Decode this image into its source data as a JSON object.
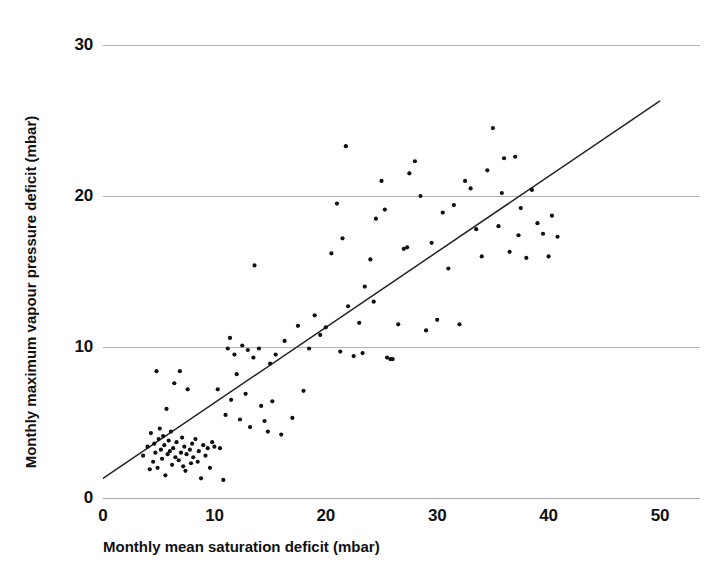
{
  "chart_data": {
    "type": "scatter",
    "title": "",
    "xlabel": "Monthly mean saturation deficit (mbar)",
    "ylabel": "Monthly maximum vapour pressure deficit (mbar)",
    "xlim": [
      0,
      50
    ],
    "ylim": [
      0,
      30
    ],
    "xticks": [
      0,
      10,
      20,
      30,
      40,
      50
    ],
    "yticks": [
      0,
      10,
      20,
      30
    ],
    "xtick_labels": [
      "0",
      "10",
      "20",
      "30",
      "40",
      "50"
    ],
    "ytick_labels": [
      "0",
      "10",
      "20",
      "30"
    ],
    "grid": "horizontal",
    "grid_color": "#aaaaaa",
    "legend": "none",
    "marker": {
      "shape": "dot",
      "size": 2.1,
      "color": "#111111"
    },
    "series": [
      {
        "name": "Monthly observations",
        "points": [
          [
            3.6,
            2.8
          ],
          [
            4.0,
            3.4
          ],
          [
            4.2,
            1.9
          ],
          [
            4.3,
            4.3
          ],
          [
            4.5,
            2.4
          ],
          [
            4.6,
            3.6
          ],
          [
            4.7,
            3.0
          ],
          [
            4.8,
            8.4
          ],
          [
            4.9,
            2.0
          ],
          [
            5.0,
            3.9
          ],
          [
            5.1,
            4.6
          ],
          [
            5.2,
            3.2
          ],
          [
            5.3,
            2.6
          ],
          [
            5.4,
            4.1
          ],
          [
            5.5,
            3.5
          ],
          [
            5.6,
            1.5
          ],
          [
            5.7,
            5.9
          ],
          [
            5.8,
            2.9
          ],
          [
            5.9,
            3.8
          ],
          [
            6.0,
            3.1
          ],
          [
            6.1,
            4.4
          ],
          [
            6.2,
            2.2
          ],
          [
            6.3,
            3.3
          ],
          [
            6.4,
            7.6
          ],
          [
            6.5,
            2.7
          ],
          [
            6.6,
            3.7
          ],
          [
            6.8,
            2.5
          ],
          [
            6.9,
            8.4
          ],
          [
            7.0,
            3.0
          ],
          [
            7.1,
            4.0
          ],
          [
            7.2,
            2.1
          ],
          [
            7.3,
            3.4
          ],
          [
            7.4,
            1.8
          ],
          [
            7.5,
            2.9
          ],
          [
            7.6,
            7.2
          ],
          [
            7.8,
            3.2
          ],
          [
            7.9,
            2.3
          ],
          [
            8.0,
            3.6
          ],
          [
            8.1,
            2.7
          ],
          [
            8.3,
            3.9
          ],
          [
            8.5,
            2.4
          ],
          [
            8.6,
            3.1
          ],
          [
            8.8,
            1.3
          ],
          [
            9.0,
            3.5
          ],
          [
            9.2,
            2.8
          ],
          [
            9.4,
            3.3
          ],
          [
            9.6,
            2.0
          ],
          [
            9.8,
            3.7
          ],
          [
            10.0,
            3.4
          ],
          [
            10.3,
            7.2
          ],
          [
            10.5,
            3.3
          ],
          [
            10.8,
            1.2
          ],
          [
            11.0,
            5.5
          ],
          [
            11.2,
            9.9
          ],
          [
            11.4,
            10.6
          ],
          [
            11.5,
            6.5
          ],
          [
            11.8,
            9.5
          ],
          [
            12.0,
            8.2
          ],
          [
            12.3,
            5.2
          ],
          [
            12.5,
            10.1
          ],
          [
            12.8,
            6.9
          ],
          [
            13.0,
            9.8
          ],
          [
            13.2,
            4.7
          ],
          [
            13.5,
            9.3
          ],
          [
            13.6,
            15.4
          ],
          [
            14.0,
            9.9
          ],
          [
            14.2,
            6.1
          ],
          [
            14.5,
            5.1
          ],
          [
            14.8,
            4.4
          ],
          [
            15.0,
            8.9
          ],
          [
            15.2,
            6.4
          ],
          [
            15.5,
            9.5
          ],
          [
            16.0,
            4.2
          ],
          [
            16.3,
            10.4
          ],
          [
            17.0,
            5.3
          ],
          [
            17.5,
            11.4
          ],
          [
            18.0,
            7.1
          ],
          [
            18.5,
            9.9
          ],
          [
            19.0,
            12.1
          ],
          [
            19.5,
            10.8
          ],
          [
            20.0,
            11.3
          ],
          [
            20.5,
            16.2
          ],
          [
            21.0,
            19.5
          ],
          [
            21.3,
            9.7
          ],
          [
            21.5,
            17.2
          ],
          [
            21.8,
            23.3
          ],
          [
            22.0,
            12.7
          ],
          [
            22.5,
            9.4
          ],
          [
            23.0,
            11.6
          ],
          [
            23.3,
            9.6
          ],
          [
            23.5,
            14.0
          ],
          [
            24.0,
            15.8
          ],
          [
            24.3,
            13.0
          ],
          [
            24.5,
            18.5
          ],
          [
            25.0,
            21.0
          ],
          [
            25.3,
            19.1
          ],
          [
            25.5,
            9.3
          ],
          [
            25.8,
            9.2
          ],
          [
            26.0,
            9.2
          ],
          [
            26.5,
            11.5
          ],
          [
            27.0,
            16.5
          ],
          [
            27.3,
            16.6
          ],
          [
            27.5,
            21.5
          ],
          [
            28.0,
            22.3
          ],
          [
            28.5,
            20.0
          ],
          [
            29.0,
            11.1
          ],
          [
            29.5,
            16.9
          ],
          [
            30.0,
            11.8
          ],
          [
            30.5,
            18.9
          ],
          [
            31.0,
            15.2
          ],
          [
            31.5,
            19.4
          ],
          [
            32.0,
            11.5
          ],
          [
            32.5,
            21.0
          ],
          [
            33.0,
            20.5
          ],
          [
            33.5,
            17.8
          ],
          [
            34.0,
            16.0
          ],
          [
            34.5,
            21.7
          ],
          [
            35.0,
            24.5
          ],
          [
            35.5,
            18.0
          ],
          [
            35.8,
            20.2
          ],
          [
            36.0,
            22.5
          ],
          [
            36.5,
            16.3
          ],
          [
            37.0,
            22.6
          ],
          [
            37.3,
            17.4
          ],
          [
            37.5,
            19.2
          ],
          [
            38.0,
            15.9
          ],
          [
            38.5,
            20.4
          ],
          [
            39.0,
            18.2
          ],
          [
            39.5,
            17.5
          ],
          [
            40.0,
            16.0
          ],
          [
            40.3,
            18.7
          ],
          [
            40.8,
            17.3
          ]
        ]
      }
    ],
    "trend_line": {
      "name": "regression line",
      "color": "#222222",
      "x_start": 0,
      "y_start": 1.3,
      "x_end": 50,
      "y_end": 26.3
    }
  }
}
